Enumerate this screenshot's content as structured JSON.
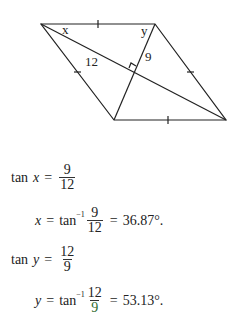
{
  "diagram": {
    "vertices": {
      "top_left": [
        41,
        24
      ],
      "top_right": [
        155,
        24
      ],
      "bottom_right": [
        226,
        120
      ],
      "bottom_left": [
        114,
        120
      ]
    },
    "labels": {
      "angle_x": "x",
      "angle_y": "y",
      "half_diagonal_long": "12",
      "half_diagonal_short": "9"
    },
    "stroke_color": "#222222"
  },
  "equations": [
    {
      "lhs_func": "tan",
      "lhs_var": "x",
      "eq": "=",
      "num": "9",
      "den": "12"
    },
    {
      "lhs_var": "x",
      "eq": "=",
      "func": "tan",
      "sup": "−1",
      "num": "9",
      "den": "12",
      "eq2": "=",
      "result": "36.87°."
    },
    {
      "lhs_func": "tan",
      "lhs_var": "y",
      "eq": "=",
      "num": "12",
      "den": "9"
    },
    {
      "lhs_var": "y",
      "eq": "=",
      "func": "tan",
      "sup": "−1",
      "num": "12",
      "den": "9",
      "den_color": "#2e6b2e",
      "eq2": "=",
      "result": "53.13°."
    }
  ]
}
